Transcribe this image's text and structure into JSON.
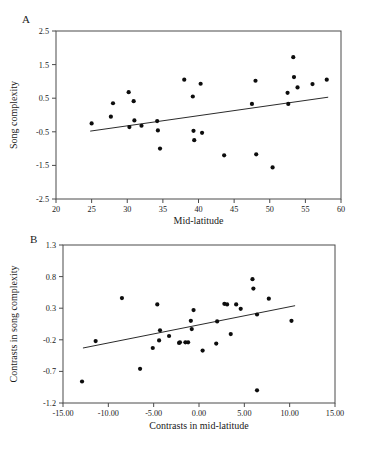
{
  "figure": {
    "panel_a_letter": "A",
    "panel_b_letter": "B"
  },
  "chart_data": [
    {
      "panel": "A",
      "type": "scatter",
      "title": "",
      "xlabel": "Mid-latitude",
      "ylabel": "Song complexity",
      "xlim": [
        20,
        60
      ],
      "ylim": [
        -2.5,
        2.5
      ],
      "xticks": [
        20,
        25,
        30,
        35,
        40,
        45,
        50,
        55,
        60
      ],
      "xticklabels": [
        "20",
        "25",
        "30",
        "35",
        "40",
        "45",
        "50",
        "55",
        "60"
      ],
      "yticks": [
        -2.5,
        -1.5,
        -0.5,
        0.5,
        1.5,
        2.5
      ],
      "yticklabels": [
        "-2.5",
        "-1.5",
        "-0.5",
        "0.5",
        "1.5",
        "2.5"
      ],
      "grid": false,
      "legend": "none",
      "marker": "filled-circle",
      "points": [
        [
          25.0,
          -0.25
        ],
        [
          27.7,
          -0.05
        ],
        [
          28.0,
          0.35
        ],
        [
          30.2,
          0.68
        ],
        [
          30.3,
          -0.36
        ],
        [
          30.9,
          0.41
        ],
        [
          31.0,
          -0.16
        ],
        [
          32.0,
          -0.32
        ],
        [
          34.2,
          -0.18
        ],
        [
          34.3,
          -0.46
        ],
        [
          34.6,
          -1.0
        ],
        [
          38.0,
          1.05
        ],
        [
          39.2,
          0.55
        ],
        [
          39.3,
          -0.47
        ],
        [
          39.4,
          -0.75
        ],
        [
          40.3,
          0.93
        ],
        [
          40.5,
          -0.53
        ],
        [
          43.6,
          -1.2
        ],
        [
          47.5,
          0.33
        ],
        [
          48.0,
          1.02
        ],
        [
          48.1,
          -1.17
        ],
        [
          50.4,
          -1.56
        ],
        [
          52.5,
          0.66
        ],
        [
          52.6,
          0.33
        ],
        [
          53.3,
          1.72
        ],
        [
          53.4,
          1.13
        ],
        [
          53.9,
          0.82
        ],
        [
          56.0,
          0.92
        ],
        [
          58.0,
          1.05
        ]
      ],
      "fit_line": {
        "x0": 24.8,
        "y0": -0.48,
        "x1": 58.2,
        "y1": 0.53
      }
    },
    {
      "panel": "B",
      "type": "scatter",
      "title": "",
      "xlabel": "Contrasts in mid-latitude",
      "ylabel": "Contrasts in song complexity",
      "xlim": [
        -15.0,
        15.0
      ],
      "ylim": [
        -1.2,
        1.3
      ],
      "xticks": [
        -15,
        -10,
        -5,
        0,
        5,
        10,
        15
      ],
      "xticklabels": [
        "-15.00",
        "-10.00",
        "-5.00",
        "0.00",
        "5.00",
        "10.00",
        "15.00"
      ],
      "yticks": [
        -1.2,
        -0.7,
        -0.2,
        0.3,
        0.8,
        1.3
      ],
      "yticklabels": [
        "-1.2",
        "-0.7",
        "-0.2",
        "0.3",
        "0.8",
        "1.3"
      ],
      "grid": false,
      "legend": "none",
      "marker": "filled-circle",
      "points": [
        [
          -12.9,
          -0.86
        ],
        [
          -11.4,
          -0.22
        ],
        [
          -8.5,
          0.46
        ],
        [
          -6.5,
          -0.66
        ],
        [
          -5.1,
          -0.33
        ],
        [
          -4.6,
          0.36
        ],
        [
          -4.4,
          -0.21
        ],
        [
          -4.3,
          -0.05
        ],
        [
          -3.3,
          -0.14
        ],
        [
          -2.2,
          -0.25
        ],
        [
          -2.1,
          -0.24
        ],
        [
          -1.5,
          -0.24
        ],
        [
          -1.2,
          -0.24
        ],
        [
          -0.9,
          0.1
        ],
        [
          -0.8,
          -0.03
        ],
        [
          -0.6,
          0.27
        ],
        [
          0.4,
          -0.37
        ],
        [
          1.9,
          -0.26
        ],
        [
          2.0,
          0.09
        ],
        [
          2.8,
          0.37
        ],
        [
          3.1,
          0.36
        ],
        [
          3.5,
          -0.11
        ],
        [
          4.1,
          0.36
        ],
        [
          4.6,
          0.29
        ],
        [
          5.9,
          0.76
        ],
        [
          6.0,
          0.61
        ],
        [
          6.4,
          0.2
        ],
        [
          6.4,
          -1.0
        ],
        [
          7.7,
          0.45
        ],
        [
          10.2,
          0.1
        ]
      ],
      "fit_line": {
        "x0": -12.8,
        "y0": -0.33,
        "x1": 10.6,
        "y1": 0.34
      }
    }
  ]
}
